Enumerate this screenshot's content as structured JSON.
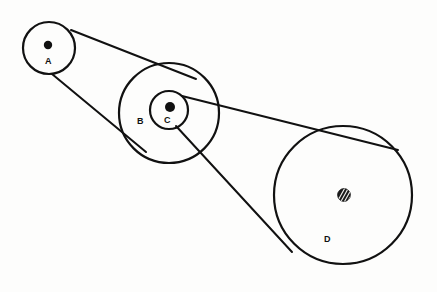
{
  "figure": {
    "background_color": "#fdfdfc",
    "line_color": "#111111",
    "width": 437,
    "height": 292
  },
  "pulleys": [
    {
      "id": "A",
      "label": "A",
      "center": {
        "x": 49,
        "y": 48
      },
      "radius": 26,
      "rim_stroke_width": 2.2,
      "hub": {
        "type": "solid-dot",
        "x": 48,
        "y": 45,
        "radius": 4.2
      },
      "label_position": {
        "x": 45,
        "y": 64
      }
    },
    {
      "id": "B",
      "label": "B",
      "center": {
        "x": 169,
        "y": 113
      },
      "radius": 50,
      "rim_stroke_width": 2.2,
      "hub": null,
      "label_position": {
        "x": 137,
        "y": 124
      }
    },
    {
      "id": "C",
      "label": "C",
      "center": {
        "x": 169,
        "y": 110
      },
      "radius": 19,
      "rim_stroke_width": 2.2,
      "hub": {
        "type": "solid-dot",
        "x": 170,
        "y": 107,
        "radius": 5.0
      },
      "label_position": {
        "x": 164,
        "y": 123
      }
    },
    {
      "id": "D",
      "label": "D",
      "center": {
        "x": 343,
        "y": 195
      },
      "radius": 69,
      "rim_stroke_width": 2.2,
      "hub": {
        "type": "hatched-dot",
        "x": 344,
        "y": 195,
        "radius": 6.4
      },
      "label_position": {
        "x": 324,
        "y": 242
      }
    }
  ],
  "belts": [
    {
      "id": "belt-AB-upper",
      "type": "open",
      "from": "A",
      "to": "B",
      "stroke_width": 2.0,
      "points": [
        {
          "x": 71,
          "y": 30
        },
        {
          "x": 196,
          "y": 79
        }
      ]
    },
    {
      "id": "belt-AB-lower",
      "type": "open",
      "from": "A",
      "to": "B",
      "stroke_width": 2.0,
      "points": [
        {
          "x": 52,
          "y": 74
        },
        {
          "x": 146,
          "y": 152
        }
      ]
    },
    {
      "id": "belt-CD-upper",
      "type": "crossed",
      "from": "C",
      "to": "D",
      "stroke_width": 2.0,
      "points": [
        {
          "x": 182,
          "y": 96
        },
        {
          "x": 398,
          "y": 150
        }
      ]
    },
    {
      "id": "belt-CD-lower",
      "type": "crossed",
      "from": "C",
      "to": "D",
      "stroke_width": 2.0,
      "points": [
        {
          "x": 176,
          "y": 126
        },
        {
          "x": 292,
          "y": 252
        }
      ]
    }
  ]
}
